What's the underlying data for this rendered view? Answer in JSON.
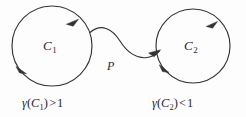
{
  "figure": {
    "name": "two-cycles-connected-by-path",
    "background_color": "#fdfdfd",
    "stroke_color": "#333333",
    "text_color": "#2a2a2a",
    "width": 246,
    "height": 117
  },
  "cycles": [
    {
      "id": "C1",
      "label_gamma": "γ",
      "label_base": "C",
      "label_sub": "1",
      "orientation": "counterclockwise",
      "center_x": 52,
      "center_y": 46,
      "radius": 40,
      "condition": {
        "gamma": "γ",
        "open_paren": "(",
        "var": "C",
        "sub": "1",
        "close_paren": ")",
        "relation": ">",
        "value": "1",
        "full_text": "γ(C₁) > 1"
      }
    },
    {
      "id": "C2",
      "label_gamma": "γ",
      "label_base": "C",
      "label_sub": "2",
      "orientation": "counterclockwise",
      "center_x": 193,
      "center_y": 46,
      "radius": 37,
      "condition": {
        "gamma": "γ",
        "open_paren": "(",
        "var": "C",
        "sub": "2",
        "close_paren": ")",
        "relation": "<",
        "value": "1",
        "full_text": "γ(C₂) < 1"
      }
    }
  ],
  "connector": {
    "id": "P",
    "label": "P",
    "shape": "s-curve",
    "direction": "C1-to-C2",
    "arrowhead": "at-C2-end"
  },
  "arrow_markers": [
    {
      "name": "c1-top-arrow",
      "on": "C1",
      "position": "top-right",
      "points": "counterclockwise"
    },
    {
      "name": "c1-bottom-arrow",
      "on": "C1",
      "position": "bottom-left",
      "points": "counterclockwise"
    },
    {
      "name": "c2-top-arrow",
      "on": "C2",
      "position": "top-right",
      "points": "counterclockwise"
    },
    {
      "name": "c2-bottom-arrow",
      "on": "C2",
      "position": "bottom-left",
      "points": "counterclockwise"
    }
  ]
}
